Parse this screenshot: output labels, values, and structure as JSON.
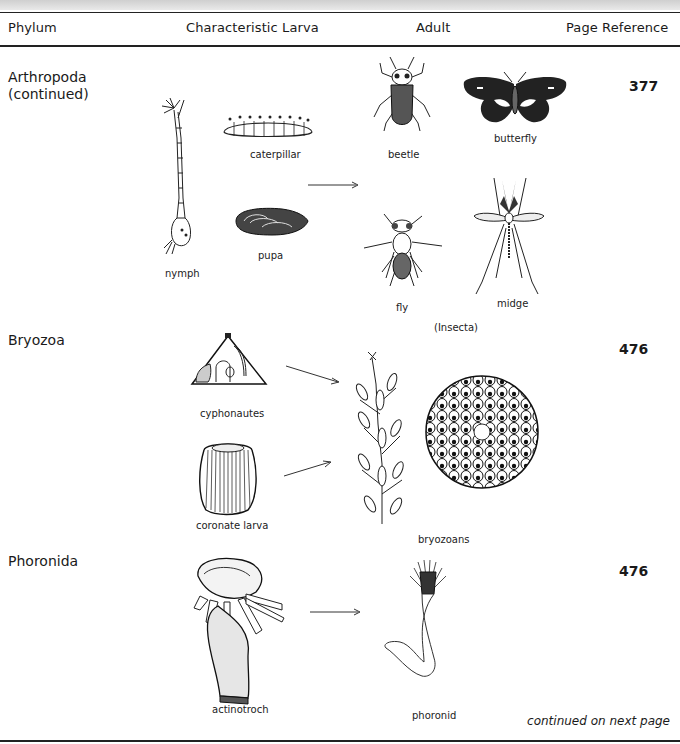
{
  "header": {
    "columns": [
      "Phylum",
      "Characteristic Larva",
      "Adult",
      "Page Reference"
    ]
  },
  "rows": [
    {
      "phylum": "Arthropoda",
      "phylum_sub": "(continued)",
      "page_reference": "377",
      "larvae": [
        "caterpillar",
        "nymph",
        "pupa"
      ],
      "adults": [
        "beetle",
        "butterfly",
        "fly",
        "midge"
      ],
      "group_note": "(Insecta)"
    },
    {
      "phylum": "Bryozoa",
      "page_reference": "476",
      "larvae": [
        "cyphonautes",
        "coronate larva"
      ],
      "adults": [
        "bryozoans"
      ]
    },
    {
      "phylum": "Phoronida",
      "page_reference": "476",
      "larvae": [
        "actinotroch"
      ],
      "adults": [
        "phoronid"
      ]
    }
  ],
  "footer": {
    "continued": "continued on next page"
  }
}
